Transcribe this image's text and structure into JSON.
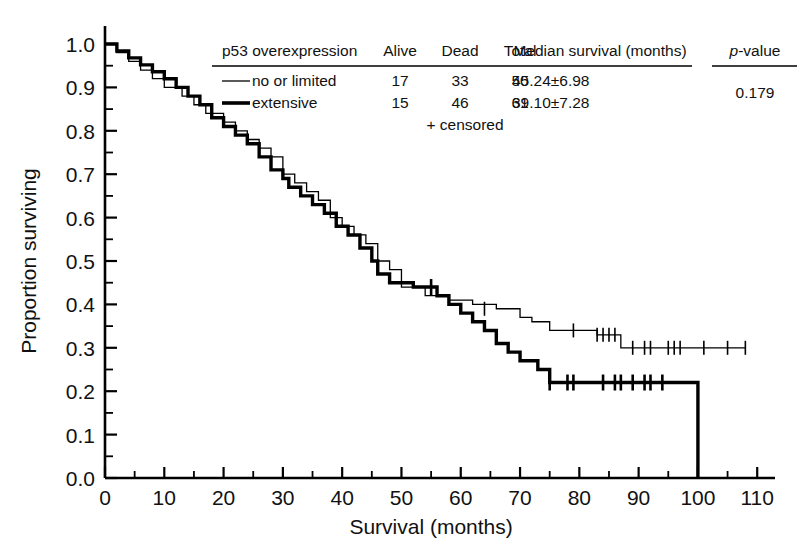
{
  "chart_data": {
    "type": "line",
    "subtype": "kaplan-meier-step",
    "title": "",
    "xlabel": "Survival (months)",
    "ylabel": "Proportion surviving",
    "xlim": [
      0,
      113
    ],
    "ylim": [
      0.0,
      1.0
    ],
    "xticks": [
      0,
      10,
      20,
      30,
      40,
      50,
      60,
      70,
      80,
      90,
      100,
      110
    ],
    "xtick_labels": [
      "0",
      "10",
      "20",
      "30",
      "40",
      "50",
      "60",
      "70",
      "80",
      "90",
      "100",
      "110"
    ],
    "xminor_step": 5,
    "yticks": [
      0.0,
      0.1,
      0.2,
      0.3,
      0.4,
      0.5,
      0.6,
      0.7,
      0.8,
      0.9,
      1.0
    ],
    "ytick_labels": [
      "0.0",
      "0.1",
      "0.2",
      "0.3",
      "0.4",
      "0.5",
      "0.6",
      "0.7",
      "0.8",
      "0.9",
      "1.0"
    ],
    "yminor_step": 0.05,
    "grid": false,
    "legend_position": "top-inside",
    "censor_marker": "+",
    "censor_note": "+ censored",
    "series": [
      {
        "name": "no or limited",
        "line_width": 1.3,
        "color": "#000000",
        "points": [
          [
            0,
            1.0
          ],
          [
            2,
            0.98
          ],
          [
            4,
            0.96
          ],
          [
            6,
            0.94
          ],
          [
            8,
            0.92
          ],
          [
            10,
            0.9
          ],
          [
            13,
            0.88
          ],
          [
            15,
            0.86
          ],
          [
            17,
            0.84
          ],
          [
            20,
            0.82
          ],
          [
            22,
            0.8
          ],
          [
            24,
            0.78
          ],
          [
            26,
            0.76
          ],
          [
            28,
            0.74
          ],
          [
            30,
            0.7
          ],
          [
            32,
            0.68
          ],
          [
            34,
            0.66
          ],
          [
            36,
            0.64
          ],
          [
            38,
            0.6
          ],
          [
            40,
            0.58
          ],
          [
            42,
            0.56
          ],
          [
            44,
            0.54
          ],
          [
            46,
            0.5
          ],
          [
            48,
            0.48
          ],
          [
            50,
            0.44
          ],
          [
            54,
            0.42
          ],
          [
            58,
            0.41
          ],
          [
            62,
            0.4
          ],
          [
            66,
            0.39
          ],
          [
            70,
            0.37
          ],
          [
            72,
            0.36
          ],
          [
            75,
            0.34
          ],
          [
            83,
            0.33
          ],
          [
            87,
            0.3
          ],
          [
            108,
            0.3
          ]
        ],
        "censored": [
          [
            64,
            0.39
          ],
          [
            79,
            0.34
          ],
          [
            83,
            0.33
          ],
          [
            84,
            0.33
          ],
          [
            85,
            0.33
          ],
          [
            86,
            0.33
          ],
          [
            89,
            0.3
          ],
          [
            91,
            0.3
          ],
          [
            92,
            0.3
          ],
          [
            95,
            0.3
          ],
          [
            96,
            0.3
          ],
          [
            97,
            0.3
          ],
          [
            101,
            0.3
          ],
          [
            105,
            0.3
          ],
          [
            108,
            0.3
          ]
        ]
      },
      {
        "name": "extensive",
        "line_width": 3.4,
        "color": "#000000",
        "points": [
          [
            0,
            1.0
          ],
          [
            2,
            0.984
          ],
          [
            4,
            0.968
          ],
          [
            6,
            0.952
          ],
          [
            8,
            0.936
          ],
          [
            10,
            0.92
          ],
          [
            12,
            0.9
          ],
          [
            14,
            0.88
          ],
          [
            16,
            0.86
          ],
          [
            18,
            0.83
          ],
          [
            20,
            0.81
          ],
          [
            22,
            0.79
          ],
          [
            24,
            0.77
          ],
          [
            26,
            0.74
          ],
          [
            28,
            0.71
          ],
          [
            30,
            0.69
          ],
          [
            31,
            0.67
          ],
          [
            33,
            0.65
          ],
          [
            35,
            0.63
          ],
          [
            37,
            0.61
          ],
          [
            39,
            0.58
          ],
          [
            41,
            0.56
          ],
          [
            43,
            0.53
          ],
          [
            45,
            0.5
          ],
          [
            46,
            0.47
          ],
          [
            48,
            0.45
          ],
          [
            52,
            0.44
          ],
          [
            56,
            0.42
          ],
          [
            58,
            0.4
          ],
          [
            60,
            0.38
          ],
          [
            62,
            0.36
          ],
          [
            64,
            0.34
          ],
          [
            66,
            0.31
          ],
          [
            68,
            0.29
          ],
          [
            70,
            0.27
          ],
          [
            73,
            0.25
          ],
          [
            75,
            0.22
          ],
          [
            100,
            0.22
          ],
          [
            100,
            0.0
          ]
        ],
        "censored": [
          [
            55,
            0.44
          ],
          [
            75,
            0.22
          ],
          [
            78,
            0.22
          ],
          [
            79,
            0.22
          ],
          [
            84,
            0.22
          ],
          [
            86,
            0.22
          ],
          [
            87,
            0.22
          ],
          [
            89,
            0.22
          ],
          [
            91,
            0.22
          ],
          [
            92,
            0.22
          ],
          [
            94,
            0.22
          ]
        ]
      }
    ]
  },
  "legend_table": {
    "headers": {
      "group": "p53 overexpression",
      "alive": "Alive",
      "dead": "Dead",
      "total": "Total",
      "median": "Median survival (months)",
      "pvalue_italic": "p",
      "pvalue_rest": "-value"
    },
    "rows": [
      {
        "label": "no or limited",
        "alive": "17",
        "dead": "33",
        "total": "50",
        "median": "45.24±6.98",
        "swatch": "thin"
      },
      {
        "label": "extensive",
        "alive": "15",
        "dead": "46",
        "total": "61",
        "median": "39.10±7.28",
        "swatch": "thick"
      }
    ],
    "pvalue": "0.179",
    "footnote": "+ censored"
  }
}
